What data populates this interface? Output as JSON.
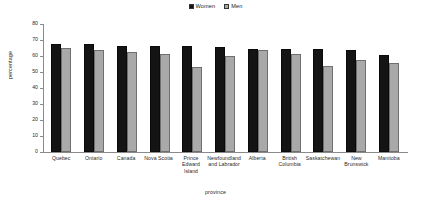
{
  "chart_data": {
    "type": "bar",
    "title": "",
    "xlabel": "province",
    "ylabel": "percentage",
    "ylim": [
      0,
      80
    ],
    "yticks": [
      0,
      10,
      20,
      30,
      40,
      50,
      60,
      70,
      80
    ],
    "grid": false,
    "legend_position": "top-center",
    "categories": [
      "Quebec",
      "Ontario",
      "Canada",
      "Nova Scotia",
      "Prince Edward Island",
      "Newfoundland and Labrador",
      "Alberta",
      "British Columbia",
      "Saskatchewan",
      "New Brunswick",
      "Manitoba"
    ],
    "series": [
      {
        "name": "Women",
        "color": "#141414",
        "values": [
          67.8,
          67.8,
          66.2,
          66.2,
          66.0,
          65.6,
          64.5,
          64.4,
          64.3,
          63.7,
          60.5
        ]
      },
      {
        "name": "Men",
        "color": "#a9a9a9",
        "values": [
          65.2,
          63.5,
          62.7,
          61.3,
          52.9,
          60.1,
          63.7,
          61.3,
          53.6,
          57.8,
          55.5
        ]
      }
    ]
  },
  "legend": {
    "entries": [
      {
        "label": "Women"
      },
      {
        "label": "Men"
      }
    ]
  }
}
